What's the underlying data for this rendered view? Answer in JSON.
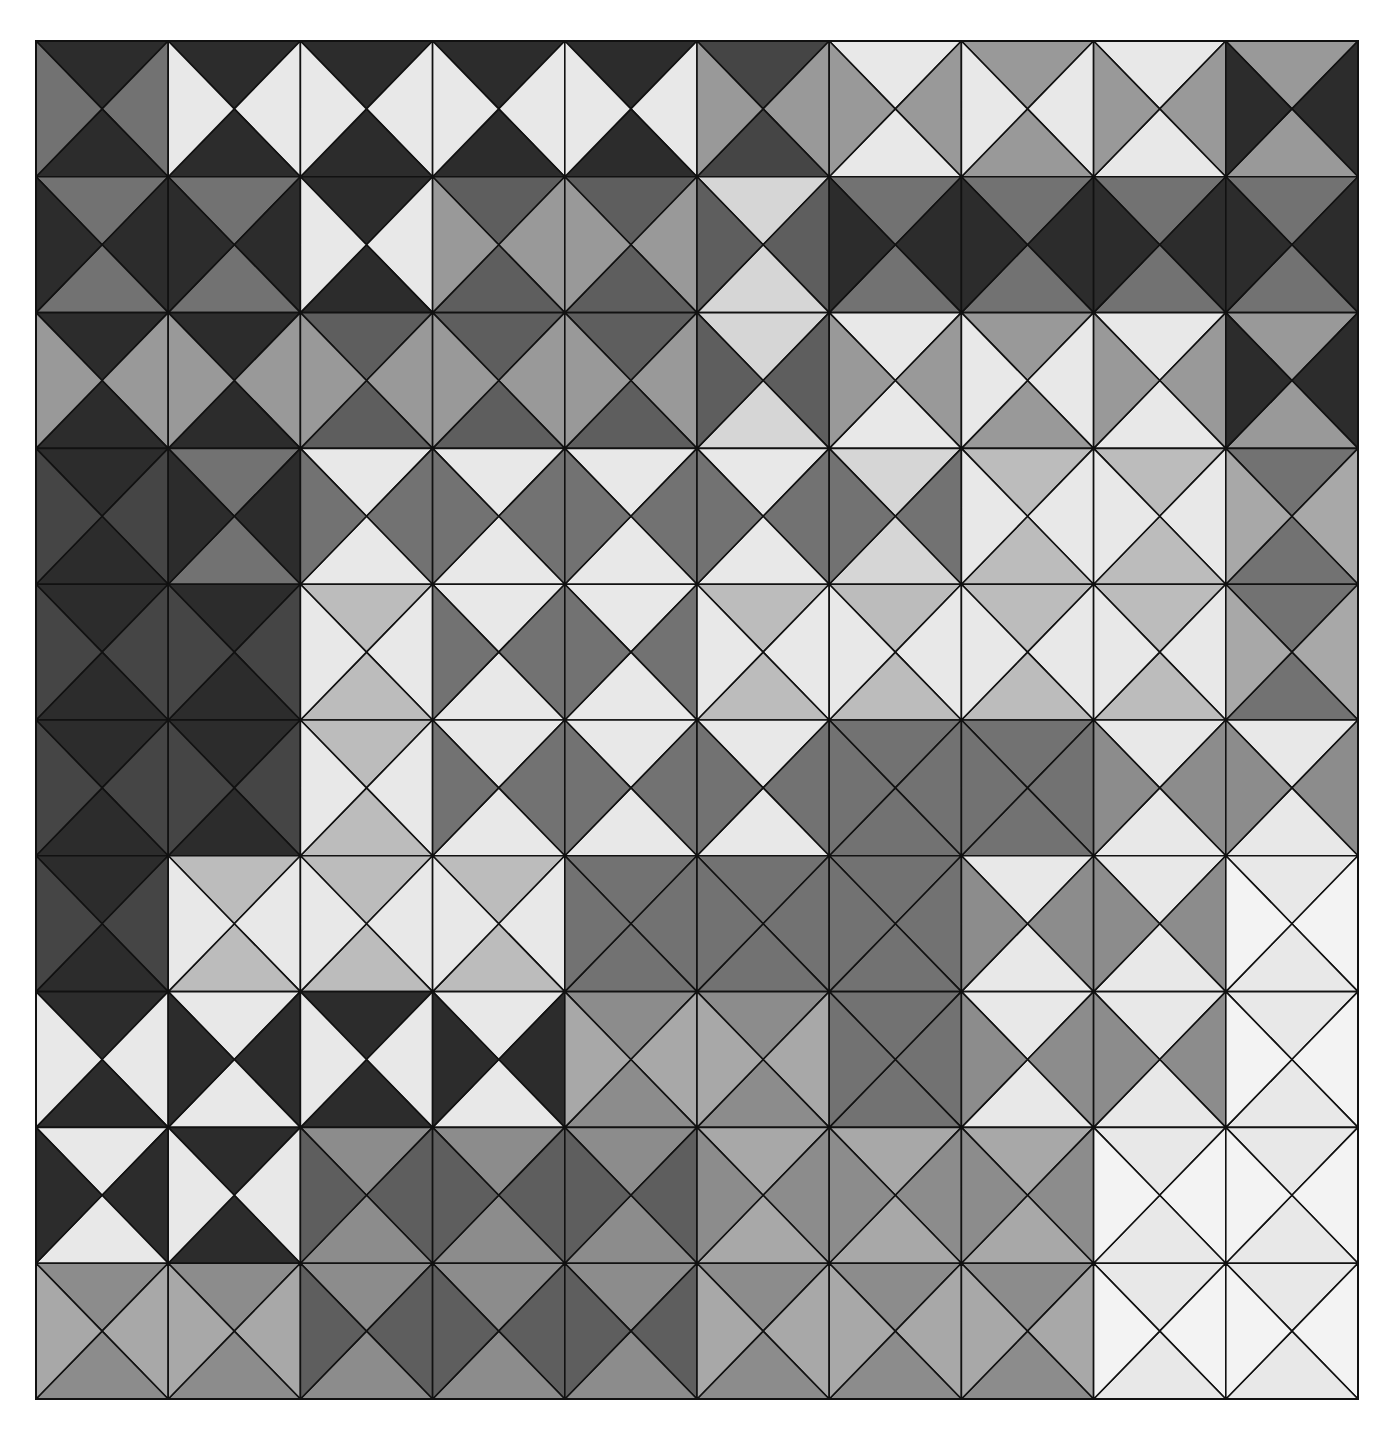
{
  "artwork": {
    "type": "geometric-quilt-pattern",
    "grid": {
      "rows": 10,
      "cols": 10,
      "cell_width": 132.2,
      "cell_height": 135.8
    },
    "palette": {
      "D": "#2c2c2c",
      "E": "#454545",
      "M": "#5e5e5e",
      "N": "#727272",
      "G": "#8c8c8c",
      "H": "#999999",
      "A": "#a8a8a8",
      "L": "#bcbcbc",
      "K": "#d6d6d6",
      "W": "#e8e8e8",
      "X": "#f3f3f3"
    },
    "cell_order": "each cell = [top, right, bottom, left] triangle shades",
    "cells": [
      [
        [
          "D",
          "N",
          "D",
          "N"
        ],
        [
          "D",
          "W",
          "D",
          "W"
        ],
        [
          "D",
          "W",
          "D",
          "W"
        ],
        [
          "D",
          "W",
          "D",
          "W"
        ],
        [
          "D",
          "W",
          "D",
          "W"
        ],
        [
          "E",
          "H",
          "E",
          "H"
        ],
        [
          "W",
          "H",
          "W",
          "H"
        ],
        [
          "H",
          "W",
          "H",
          "W"
        ],
        [
          "W",
          "H",
          "W",
          "H"
        ],
        [
          "H",
          "D",
          "H",
          "D"
        ]
      ],
      [
        [
          "N",
          "D",
          "N",
          "D"
        ],
        [
          "N",
          "D",
          "N",
          "D"
        ],
        [
          "D",
          "W",
          "D",
          "W"
        ],
        [
          "M",
          "H",
          "M",
          "H"
        ],
        [
          "M",
          "H",
          "M",
          "H"
        ],
        [
          "K",
          "M",
          "K",
          "M"
        ],
        [
          "N",
          "D",
          "N",
          "D"
        ],
        [
          "N",
          "D",
          "N",
          "D"
        ],
        [
          "N",
          "D",
          "N",
          "D"
        ],
        [
          "N",
          "D",
          "N",
          "D"
        ]
      ],
      [
        [
          "D",
          "H",
          "D",
          "H"
        ],
        [
          "D",
          "H",
          "D",
          "H"
        ],
        [
          "M",
          "H",
          "M",
          "H"
        ],
        [
          "M",
          "H",
          "M",
          "H"
        ],
        [
          "M",
          "H",
          "M",
          "H"
        ],
        [
          "K",
          "M",
          "K",
          "M"
        ],
        [
          "W",
          "H",
          "W",
          "H"
        ],
        [
          "H",
          "W",
          "H",
          "W"
        ],
        [
          "W",
          "H",
          "W",
          "H"
        ],
        [
          "H",
          "D",
          "H",
          "D"
        ]
      ],
      [
        [
          "D",
          "E",
          "D",
          "E"
        ],
        [
          "N",
          "D",
          "N",
          "D"
        ],
        [
          "W",
          "N",
          "W",
          "N"
        ],
        [
          "W",
          "N",
          "W",
          "N"
        ],
        [
          "W",
          "N",
          "W",
          "N"
        ],
        [
          "W",
          "N",
          "W",
          "N"
        ],
        [
          "K",
          "N",
          "K",
          "N"
        ],
        [
          "L",
          "W",
          "L",
          "W"
        ],
        [
          "L",
          "W",
          "L",
          "W"
        ],
        [
          "N",
          "A",
          "N",
          "A"
        ]
      ],
      [
        [
          "D",
          "E",
          "D",
          "E"
        ],
        [
          "D",
          "E",
          "D",
          "E"
        ],
        [
          "L",
          "W",
          "L",
          "W"
        ],
        [
          "W",
          "N",
          "W",
          "N"
        ],
        [
          "W",
          "N",
          "W",
          "N"
        ],
        [
          "L",
          "W",
          "L",
          "W"
        ],
        [
          "L",
          "W",
          "L",
          "W"
        ],
        [
          "L",
          "W",
          "L",
          "W"
        ],
        [
          "L",
          "W",
          "L",
          "W"
        ],
        [
          "N",
          "A",
          "N",
          "A"
        ]
      ],
      [
        [
          "D",
          "E",
          "D",
          "E"
        ],
        [
          "D",
          "E",
          "D",
          "E"
        ],
        [
          "L",
          "W",
          "L",
          "W"
        ],
        [
          "W",
          "N",
          "W",
          "N"
        ],
        [
          "W",
          "N",
          "W",
          "N"
        ],
        [
          "W",
          "N",
          "W",
          "N"
        ],
        [
          "N",
          "N",
          "N",
          "N"
        ],
        [
          "N",
          "N",
          "N",
          "N"
        ],
        [
          "W",
          "G",
          "W",
          "G"
        ],
        [
          "W",
          "G",
          "W",
          "G"
        ]
      ],
      [
        [
          "D",
          "E",
          "D",
          "E"
        ],
        [
          "L",
          "W",
          "L",
          "W"
        ],
        [
          "L",
          "W",
          "L",
          "W"
        ],
        [
          "L",
          "W",
          "L",
          "W"
        ],
        [
          "N",
          "N",
          "N",
          "N"
        ],
        [
          "N",
          "N",
          "N",
          "N"
        ],
        [
          "N",
          "N",
          "N",
          "N"
        ],
        [
          "W",
          "G",
          "W",
          "G"
        ],
        [
          "W",
          "G",
          "W",
          "G"
        ],
        [
          "W",
          "X",
          "W",
          "X"
        ]
      ],
      [
        [
          "D",
          "W",
          "D",
          "W"
        ],
        [
          "W",
          "D",
          "W",
          "D"
        ],
        [
          "D",
          "W",
          "D",
          "W"
        ],
        [
          "W",
          "D",
          "W",
          "D"
        ],
        [
          "G",
          "A",
          "G",
          "A"
        ],
        [
          "G",
          "A",
          "G",
          "A"
        ],
        [
          "N",
          "N",
          "N",
          "N"
        ],
        [
          "W",
          "G",
          "W",
          "G"
        ],
        [
          "W",
          "G",
          "W",
          "G"
        ],
        [
          "W",
          "X",
          "W",
          "X"
        ]
      ],
      [
        [
          "W",
          "D",
          "W",
          "D"
        ],
        [
          "D",
          "W",
          "D",
          "W"
        ],
        [
          "G",
          "M",
          "G",
          "M"
        ],
        [
          "G",
          "M",
          "G",
          "M"
        ],
        [
          "G",
          "M",
          "G",
          "M"
        ],
        [
          "A",
          "G",
          "A",
          "G"
        ],
        [
          "A",
          "G",
          "A",
          "G"
        ],
        [
          "A",
          "G",
          "A",
          "G"
        ],
        [
          "W",
          "X",
          "W",
          "X"
        ],
        [
          "W",
          "X",
          "W",
          "X"
        ]
      ],
      [
        [
          "G",
          "A",
          "G",
          "A"
        ],
        [
          "G",
          "A",
          "G",
          "A"
        ],
        [
          "G",
          "M",
          "G",
          "M"
        ],
        [
          "G",
          "M",
          "G",
          "M"
        ],
        [
          "G",
          "M",
          "G",
          "M"
        ],
        [
          "G",
          "A",
          "G",
          "A"
        ],
        [
          "G",
          "A",
          "G",
          "A"
        ],
        [
          "G",
          "A",
          "G",
          "A"
        ],
        [
          "W",
          "X",
          "W",
          "X"
        ],
        [
          "W",
          "X",
          "W",
          "X"
        ]
      ]
    ],
    "line_color": "#111111"
  }
}
